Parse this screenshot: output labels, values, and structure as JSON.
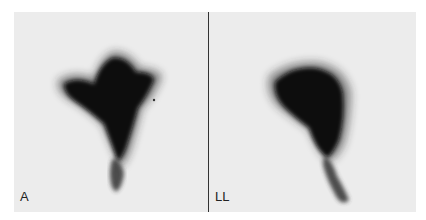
{
  "figure": {
    "panels": [
      {
        "label": "A",
        "description": "anterior scintigraphic view, dark uptake region with tapering tail"
      },
      {
        "label": "LL",
        "description": "left lateral scintigraphic view, dark uptake region with tapering tail"
      }
    ],
    "colors": {
      "background": "#ececec",
      "uptake": "#0a0a0a",
      "divider": "#333333"
    }
  }
}
